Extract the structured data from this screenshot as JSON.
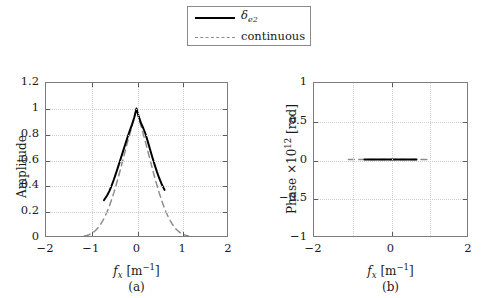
{
  "legend": {
    "entries": [
      {
        "label": "δ",
        "sub": "e2",
        "style": "solid",
        "color": "#000000",
        "sample_name": "solid-line-sample"
      },
      {
        "label": "continuous",
        "sub": "",
        "style": "dashed",
        "color": "#8c8c8c",
        "sample_name": "dashed-line-sample"
      }
    ]
  },
  "colors": {
    "discrete": "#000000",
    "continuous": "#8c8c8c",
    "axis": "#7d7d7d",
    "grid": "#cfcfcf",
    "background": "#ffffff"
  },
  "chart_data": [
    {
      "type": "line",
      "panel": "a",
      "panel_label": "(a)",
      "title": "",
      "xlabel": "f_x [m^-1]",
      "xlabel_parts": {
        "base": "f",
        "sub": "x",
        "unit_open": " [m",
        "unit_sup": "−1",
        "unit_close": "]"
      },
      "ylabel": "Amplitude",
      "xlim": [
        -2,
        2
      ],
      "ylim": [
        0,
        1.2
      ],
      "xticks": [
        -2,
        -1,
        0,
        1,
        2
      ],
      "xticklabels": [
        "−2",
        "−1",
        "0",
        "1",
        "2"
      ],
      "yticks": [
        0,
        0.2,
        0.4,
        0.6,
        0.8,
        1,
        1.2
      ],
      "yticklabels": [
        "0",
        "0.2",
        "0.4",
        "0.6",
        "0.8",
        "1",
        "1.2"
      ],
      "grid": true,
      "legend_position": "above-figure",
      "series": [
        {
          "name": "continuous",
          "style": "dashed",
          "color": "#8c8c8c",
          "x": [
            -1.15,
            -1.1,
            -1.05,
            -1.0,
            -0.95,
            -0.9,
            -0.85,
            -0.8,
            -0.75,
            -0.7,
            -0.65,
            -0.6,
            -0.55,
            -0.5,
            -0.45,
            -0.4,
            -0.35,
            -0.3,
            -0.25,
            -0.2,
            -0.15,
            -0.1,
            -0.05,
            0.0,
            0.05,
            0.1,
            0.15,
            0.2,
            0.25,
            0.3,
            0.35,
            0.4,
            0.45,
            0.5,
            0.55,
            0.6,
            0.65,
            0.7,
            0.75,
            0.8,
            0.85,
            0.9,
            0.95,
            1.0,
            1.05,
            1.1,
            1.15
          ],
          "y": [
            0.0,
            0.004,
            0.01,
            0.018,
            0.03,
            0.045,
            0.064,
            0.088,
            0.117,
            0.151,
            0.19,
            0.235,
            0.285,
            0.34,
            0.4,
            0.463,
            0.53,
            0.598,
            0.666,
            0.734,
            0.8,
            0.862,
            0.922,
            1.0,
            0.922,
            0.862,
            0.8,
            0.734,
            0.666,
            0.598,
            0.53,
            0.463,
            0.4,
            0.34,
            0.285,
            0.235,
            0.19,
            0.151,
            0.117,
            0.088,
            0.064,
            0.045,
            0.03,
            0.018,
            0.01,
            0.004,
            0.0
          ]
        },
        {
          "name": "δe2",
          "style": "solid",
          "color": "#000000",
          "x": [
            -0.72,
            -0.65,
            -0.6,
            -0.55,
            -0.5,
            -0.45,
            -0.4,
            -0.35,
            -0.3,
            -0.25,
            -0.2,
            -0.15,
            -0.1,
            -0.05,
            0.0,
            0.05,
            0.1,
            0.15,
            0.2,
            0.25,
            0.3,
            0.35,
            0.4,
            0.45,
            0.5,
            0.55,
            0.6,
            0.62
          ],
          "y": [
            0.28,
            0.318,
            0.352,
            0.395,
            0.443,
            0.495,
            0.55,
            0.606,
            0.662,
            0.718,
            0.772,
            0.824,
            0.874,
            0.93,
            1.0,
            0.936,
            0.885,
            0.845,
            0.8,
            0.74,
            0.678,
            0.618,
            0.56,
            0.505,
            0.455,
            0.412,
            0.375,
            0.362
          ]
        }
      ]
    },
    {
      "type": "line",
      "panel": "b",
      "panel_label": "(b)",
      "title": "",
      "xlabel": "f_x [m^-1]",
      "xlabel_parts": {
        "base": "f",
        "sub": "x",
        "unit_open": " [m",
        "unit_sup": "−1",
        "unit_close": "]"
      },
      "ylabel": "Phase ×10^12 [rad]",
      "ylabel_parts": {
        "base": "Phase ×10",
        "sup": "12",
        "tail": " [rad]"
      },
      "xlim": [
        -2,
        2
      ],
      "ylim": [
        -1,
        1
      ],
      "xticks": [
        -2,
        0,
        2
      ],
      "xticklabels": [
        "−2",
        "0",
        "2"
      ],
      "yticks": [
        -1,
        -0.5,
        0,
        0.5,
        1
      ],
      "yticklabels": [
        "−1",
        "−0.5",
        "0",
        "0.5",
        "1"
      ],
      "grid": true,
      "series": [
        {
          "name": "continuous",
          "style": "dashed",
          "color": "#8c8c8c",
          "x": [
            -1.1,
            -0.9,
            -0.7,
            -0.5,
            -0.3,
            -0.1,
            0.1,
            0.3,
            0.5,
            0.7,
            0.9,
            1.05
          ],
          "y": [
            0,
            0,
            0,
            0,
            0,
            0,
            0,
            0,
            0,
            0,
            0,
            0
          ]
        },
        {
          "name": "δe2",
          "style": "solid",
          "color": "#000000",
          "x": [
            -0.68,
            -0.45,
            -0.2,
            0.0,
            0.2,
            0.45,
            0.68
          ],
          "y": [
            0,
            0,
            0,
            0,
            0,
            0,
            0
          ]
        }
      ]
    }
  ]
}
